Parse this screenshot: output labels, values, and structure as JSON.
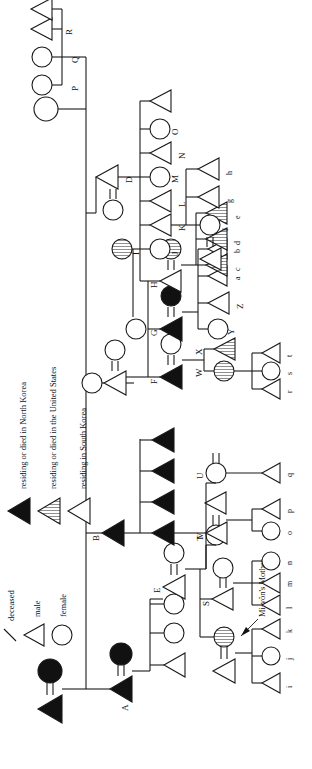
{
  "figure": {
    "type": "kinship-genealogy-chart",
    "orientation": "rotated-90-ccw",
    "highlighted_person_label": "Mi-yŏn's Mother"
  },
  "legend": {
    "symbols": [
      {
        "key": "deceased",
        "glyph": "slash",
        "label": "deceased"
      },
      {
        "key": "male",
        "glyph": "triangle-open",
        "label": "male"
      },
      {
        "key": "female",
        "glyph": "circle-open",
        "label": "female"
      }
    ],
    "shading": [
      {
        "key": "north-korea",
        "glyph": "triangle-solid",
        "label": "residing or died in North Korea"
      },
      {
        "key": "united-states",
        "glyph": "triangle-hatched",
        "label": "residing or died in the United States"
      },
      {
        "key": "south-korea",
        "glyph": "triangle-open",
        "label": "residing in South Korea"
      }
    ]
  },
  "generations": {
    "g0": {
      "label": "founding couple",
      "members": [
        {
          "id": "anc_m",
          "sex": "male",
          "fill": "solid"
        },
        {
          "id": "anc_f",
          "sex": "female",
          "fill": "solid"
        }
      ]
    },
    "g1": [
      {
        "id": "A",
        "label": "A",
        "sex": "male",
        "fill": "solid",
        "spouse_fill": "solid"
      },
      {
        "id": "B",
        "label": "B",
        "sex": "male",
        "fill": "solid"
      },
      {
        "id": "C",
        "label": "C",
        "sex": "male",
        "fill": "open",
        "wives": 2
      },
      {
        "id": "D",
        "label": "D",
        "sex": "male",
        "fill": "open",
        "spouse_fill": "open"
      },
      {
        "id": "anc2_f",
        "label": "",
        "sex": "female",
        "fill": "open"
      }
    ],
    "g2": [
      {
        "id": "E",
        "label": "E",
        "sex": "male",
        "fill": "open"
      },
      {
        "id": "F",
        "label": "F",
        "sex": "male",
        "fill": "solid"
      },
      {
        "id": "G",
        "label": "G",
        "sex": "male",
        "fill": "solid",
        "spouse_fill": "solid"
      },
      {
        "id": "H",
        "label": "H",
        "sex": "male",
        "fill": "open",
        "spouse_fill": "hatch"
      },
      {
        "id": "I",
        "label": "I",
        "sex": "female",
        "fill": "hatch"
      },
      {
        "id": "J",
        "label": "J",
        "sex": "female",
        "fill": "open"
      },
      {
        "id": "K",
        "label": "K",
        "sex": "male",
        "fill": "open"
      },
      {
        "id": "L",
        "label": "L",
        "sex": "male",
        "fill": "open"
      },
      {
        "id": "M",
        "label": "M",
        "sex": "female",
        "fill": "open"
      },
      {
        "id": "N",
        "label": "N",
        "sex": "male",
        "fill": "open"
      },
      {
        "id": "O",
        "label": "O",
        "sex": "female",
        "fill": "open"
      },
      {
        "id": "P",
        "label": "P",
        "sex": "female",
        "fill": "open"
      },
      {
        "id": "Q",
        "label": "Q",
        "sex": "female",
        "fill": "open"
      },
      {
        "id": "R",
        "label": "R",
        "sex": "male",
        "fill": "open"
      }
    ],
    "g3": [
      {
        "id": "S",
        "label": "S",
        "sex": "male",
        "fill": "open"
      },
      {
        "id": "T",
        "label": "T",
        "sex": "female",
        "fill": "open"
      },
      {
        "id": "U",
        "label": "U",
        "sex": "female",
        "fill": "open"
      },
      {
        "id": "V",
        "label": "V",
        "sex": "male",
        "fill": "open"
      },
      {
        "id": "W",
        "label": "W",
        "sex": "female",
        "fill": "hatch"
      },
      {
        "id": "X",
        "label": "X",
        "sex": "male",
        "fill": "hatch"
      },
      {
        "id": "Y",
        "label": "Y",
        "sex": "female",
        "fill": "open"
      },
      {
        "id": "Z",
        "label": "Z",
        "sex": "male",
        "fill": "open"
      }
    ],
    "g4": [
      {
        "id": "i",
        "label": "i",
        "sex": "male",
        "fill": "open"
      },
      {
        "id": "j",
        "label": "j",
        "sex": "female",
        "fill": "open"
      },
      {
        "id": "k",
        "label": "k",
        "sex": "male",
        "fill": "open"
      },
      {
        "id": "l",
        "label": "l",
        "sex": "male",
        "fill": "open"
      },
      {
        "id": "m",
        "label": "m",
        "sex": "male",
        "fill": "open"
      },
      {
        "id": "n",
        "label": "n",
        "sex": "female",
        "fill": "open"
      },
      {
        "id": "o",
        "label": "o",
        "sex": "female",
        "fill": "open"
      },
      {
        "id": "p",
        "label": "p",
        "sex": "male",
        "fill": "open"
      },
      {
        "id": "q",
        "label": "q",
        "sex": "male",
        "fill": "open"
      },
      {
        "id": "r",
        "label": "r",
        "sex": "male",
        "fill": "open"
      },
      {
        "id": "s",
        "label": "s",
        "sex": "female",
        "fill": "open"
      },
      {
        "id": "t",
        "label": "t",
        "sex": "male",
        "fill": "open"
      },
      {
        "id": "a",
        "label": "a",
        "sex": "male",
        "fill": "open"
      },
      {
        "id": "b",
        "label": "b",
        "sex": "male",
        "fill": "open"
      },
      {
        "id": "c",
        "label": "c",
        "sex": "male",
        "fill": "hatch"
      },
      {
        "id": "d",
        "label": "d",
        "sex": "male",
        "fill": "hatch"
      },
      {
        "id": "e",
        "label": "e",
        "sex": "male",
        "fill": "hatch"
      },
      {
        "id": "f",
        "label": "f",
        "sex": "female",
        "fill": "open"
      },
      {
        "id": "g",
        "label": "g",
        "sex": "male",
        "fill": "open"
      },
      {
        "id": "h",
        "label": "h",
        "sex": "male",
        "fill": "open"
      }
    ]
  },
  "colors": {
    "ink": "#1a1a1a",
    "paper": "#ffffff",
    "solid_fill": "#111111"
  }
}
